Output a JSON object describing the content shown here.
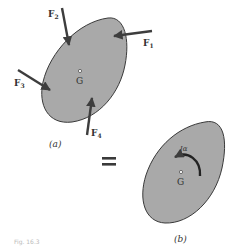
{
  "figure": {
    "part_a": {
      "label": "(a)",
      "center_label": "G",
      "forces": [
        {
          "name": "F",
          "sub": "1"
        },
        {
          "name": "F",
          "sub": "2"
        },
        {
          "name": "F",
          "sub": "3"
        },
        {
          "name": "F",
          "sub": "4"
        }
      ]
    },
    "equals": "=",
    "part_b": {
      "label": "(b)",
      "center_label": "G",
      "moment_label": "Iα"
    },
    "caption": "Fig. 16.3"
  },
  "colors": {
    "body_fill": "#a9a9a9",
    "outline": "#3a3a3a",
    "arrow": "#3d3d3d"
  }
}
